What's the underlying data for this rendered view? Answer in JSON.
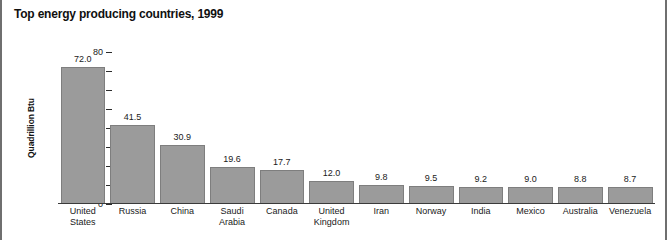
{
  "chart_data": {
    "type": "bar",
    "title": "Top energy producing countries, 1999",
    "xlabel": "",
    "ylabel": "Quadrillion Btu",
    "ylim": [
      0,
      80
    ],
    "yticks": [
      0,
      10,
      20,
      30,
      40,
      50,
      60,
      70,
      80
    ],
    "ytick_labels": [
      "0",
      "10",
      "20",
      "30",
      "40",
      "50",
      "60",
      "70",
      "80"
    ],
    "grid": false,
    "legend": false,
    "bar_color": "#9b9b9b",
    "bar_border_color": "#7e7e7e",
    "categories": [
      "United States",
      "Russia",
      "China",
      "Saudi Arabia",
      "Canada",
      "United Kingdom",
      "Iran",
      "Norway",
      "India",
      "Mexico",
      "Australia",
      "Venezuela"
    ],
    "category_lines": [
      [
        "United",
        "States"
      ],
      [
        "Russia"
      ],
      [
        "China"
      ],
      [
        "Saudi",
        "Arabia"
      ],
      [
        "Canada"
      ],
      [
        "United",
        "Kingdom"
      ],
      [
        "Iran"
      ],
      [
        "Norway"
      ],
      [
        "India"
      ],
      [
        "Mexico"
      ],
      [
        "Australia"
      ],
      [
        "Venezuela"
      ]
    ],
    "values": [
      72.0,
      41.5,
      30.9,
      19.6,
      17.7,
      12.0,
      9.8,
      9.5,
      9.2,
      9.0,
      8.8,
      8.7
    ],
    "value_labels": [
      "72.0",
      "41.5",
      "30.9",
      "19.6",
      "17.7",
      "12.0",
      "9.8",
      "9.5",
      "9.2",
      "9.0",
      "8.8",
      "8.7"
    ]
  }
}
